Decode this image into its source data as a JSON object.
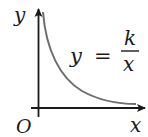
{
  "diagram": {
    "axes": {
      "x_label": "x",
      "y_label": "y",
      "origin_label": "O",
      "axis_color": "#1a1a1a"
    },
    "curve": {
      "equation_lhs": "y",
      "equation_eq": "=",
      "numerator": "k",
      "denominator": "x",
      "color": "#6e6e6e",
      "quadrant": "first"
    }
  }
}
